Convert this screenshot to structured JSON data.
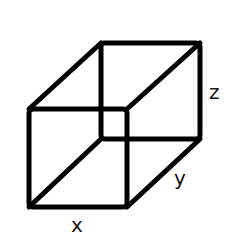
{
  "diagram": {
    "type": "wireframe rectangular box",
    "stroke_color": "#000000",
    "background": "#ffffff",
    "vertices": {
      "front_top_left": [
        29,
        109
      ],
      "front_top_right": [
        127,
        109
      ],
      "front_bottom_right": [
        127,
        207
      ],
      "front_bottom_left": [
        29,
        207
      ],
      "back_top_left": [
        101,
        43
      ],
      "back_top_right": [
        200,
        43
      ],
      "back_bottom_right": [
        200,
        139
      ],
      "back_bottom_left": [
        101,
        139
      ]
    },
    "labels": {
      "x": "x",
      "y": "y",
      "z": "z"
    }
  }
}
